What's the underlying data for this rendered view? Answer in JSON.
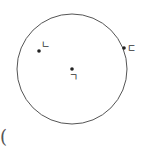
{
  "diagram": {
    "circle": {
      "cx": 72,
      "cy": 69,
      "r": 55,
      "stroke": "#555555"
    },
    "points": [
      {
        "label": "ㄴ",
        "x": 39,
        "y": 51
      },
      {
        "label": "ㄷ",
        "x": 124,
        "y": 48
      },
      {
        "label": "ㄱ",
        "x": 72,
        "y": 69
      }
    ]
  },
  "footer": {
    "paren": "("
  }
}
